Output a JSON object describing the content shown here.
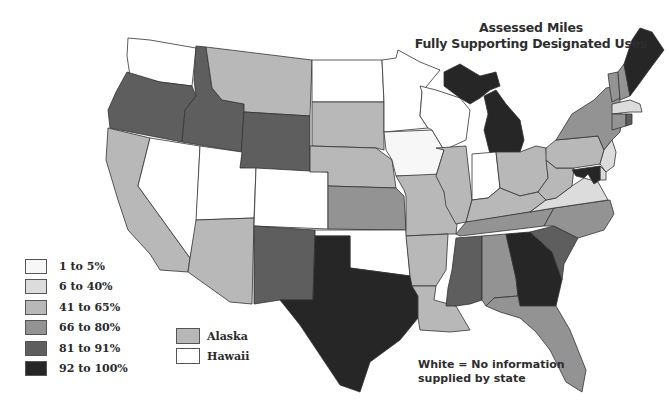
{
  "title": {
    "line1": "Assessed Miles",
    "line2": "Fully Supporting Designated Uses"
  },
  "legend": {
    "items": [
      {
        "label": "1 to 5%",
        "color": "#f7f7f7"
      },
      {
        "label": "6 to 40%",
        "color": "#dcdcdc"
      },
      {
        "label": "41 to 65%",
        "color": "#b8b8b8"
      },
      {
        "label": "66 to 80%",
        "color": "#939393"
      },
      {
        "label": "81 to 91%",
        "color": "#5e5e5e"
      },
      {
        "label": "92 to 100%",
        "color": "#262626"
      }
    ]
  },
  "insets": {
    "items": [
      {
        "label": "Alaska",
        "color": "#b8b8b8"
      },
      {
        "label": "Hawaii",
        "color": "#ffffff"
      }
    ]
  },
  "note": {
    "line1": "White = No information",
    "line2": "supplied by state"
  },
  "states": {
    "WA": "#ffffff",
    "OR": "#5e5e5e",
    "CA": "#b8b8b8",
    "ID": "#5e5e5e",
    "NV": "#ffffff",
    "MT": "#b8b8b8",
    "WY": "#5e5e5e",
    "UT": "#ffffff",
    "AZ": "#b8b8b8",
    "CO": "#ffffff",
    "NM": "#5e5e5e",
    "ND": "#ffffff",
    "SD": "#b8b8b8",
    "NE": "#b8b8b8",
    "KS": "#939393",
    "OK": "#ffffff",
    "TX": "#262626",
    "MN": "#ffffff",
    "IA": "#f7f7f7",
    "MO": "#b8b8b8",
    "AR": "#b8b8b8",
    "LA": "#b8b8b8",
    "WI": "#ffffff",
    "IL": "#b8b8b8",
    "MI": "#262626",
    "IN": "#ffffff",
    "OH": "#b8b8b8",
    "KY": "#b8b8b8",
    "TN": "#939393",
    "MS": "#5e5e5e",
    "AL": "#939393",
    "GA": "#262626",
    "FL": "#939393",
    "SC": "#5e5e5e",
    "NC": "#939393",
    "VA": "#dcdcdc",
    "WV": "#b8b8b8",
    "PA": "#b8b8b8",
    "NY": "#939393",
    "VT": "#939393",
    "NH": "#939393",
    "ME": "#262626",
    "MA": "#dcdcdc",
    "CT": "#939393",
    "RI": "#5e5e5e",
    "NJ": "#dcdcdc",
    "DE": "#dcdcdc",
    "MD": "#262626"
  }
}
